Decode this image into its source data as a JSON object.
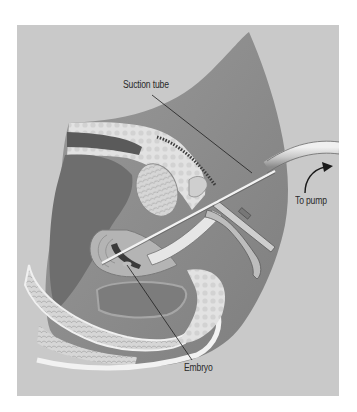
{
  "figure": {
    "labels": {
      "suction_tube": "Suction tube",
      "to_pump": "To pump",
      "embryo": "Embryo"
    },
    "colors": {
      "background_panel": "#c9c9c9",
      "body_silhouette": "#8f8f8f",
      "dark_cavity": "#6e6e6e",
      "bone_light": "#e4e4e4",
      "leader_line": "#1e1e1e",
      "tube": "#d8d8d8"
    }
  }
}
